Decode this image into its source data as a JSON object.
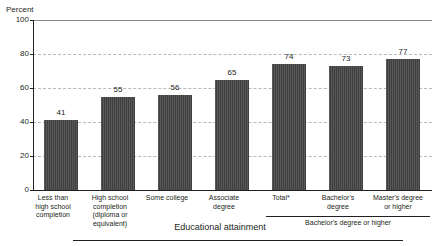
{
  "chart_data": {
    "type": "bar",
    "title": "",
    "subtitle": "",
    "ylabel": "Percent",
    "xlabel": "Educational attainment",
    "ylim": [
      0,
      100
    ],
    "yticks": [
      0,
      20,
      40,
      60,
      80,
      100
    ],
    "grid": true,
    "legend_position": "none",
    "categories": [
      "Less than high school completion",
      "High school completion (diploma or equivalent)",
      "Some college",
      "Associate degree",
      "Total*",
      "Bachelor's degree",
      "Master's degree or higher"
    ],
    "category_label_lines": [
      [
        "Less than",
        "high school",
        "completion"
      ],
      [
        "High school",
        "completion",
        "(diploma or",
        "equivalent)"
      ],
      [
        "Some college"
      ],
      [
        "Associate",
        "degree"
      ],
      [
        "Total*"
      ],
      [
        "Bachelor's",
        "degree"
      ],
      [
        "Master's degree",
        "or higher"
      ]
    ],
    "values": [
      41,
      55,
      56,
      65,
      74,
      73,
      77
    ],
    "value_labels": [
      "41",
      "55",
      "56",
      "65",
      "74",
      "73",
      "77"
    ],
    "bar_color": "#3f3f3f",
    "groups": [
      {
        "label": "Bachelor's degree or higher",
        "member_indices": [
          4,
          5,
          6
        ]
      }
    ]
  },
  "axis": {
    "y_title": "Percent",
    "y_tick_labels": [
      "100",
      "80",
      "60",
      "40",
      "20",
      "0"
    ],
    "x_caption": "Educational attainment"
  }
}
